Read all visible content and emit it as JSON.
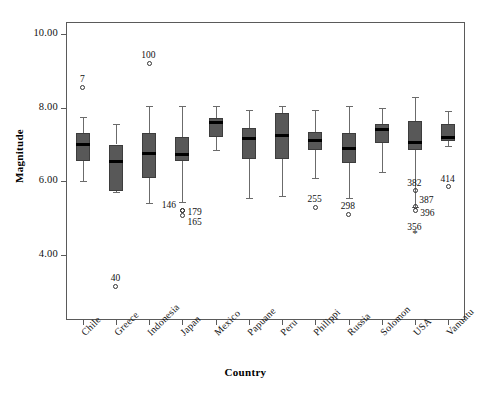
{
  "chart_data": {
    "type": "box",
    "title": "",
    "xlabel": "Country",
    "ylabel": "Magnitude",
    "ylim": [
      2.9,
      10.6
    ],
    "yticks": [
      4.0,
      6.0,
      8.0,
      10.0
    ],
    "ytick_labels": [
      "4.00",
      "6.00",
      "8.00",
      "10.00"
    ],
    "grid": false,
    "legend": "none",
    "categories": [
      "Chile",
      "Greece",
      "Indonesia",
      "Japan",
      "Mexico",
      "Papuane",
      "Peru",
      "Philippi",
      "Russia",
      "Solomon",
      "USA",
      "Vanuatu"
    ],
    "boxes": [
      {
        "category": "Chile",
        "whisker_low": 6.0,
        "q1": 6.55,
        "median": 7.0,
        "q3": 7.3,
        "whisker_high": 7.75
      },
      {
        "category": "Greece",
        "whisker_low": 5.7,
        "q1": 5.75,
        "median": 6.55,
        "q3": 7.0,
        "whisker_high": 7.55
      },
      {
        "category": "Indonesia",
        "whisker_low": 5.4,
        "q1": 6.1,
        "median": 6.75,
        "q3": 7.3,
        "whisker_high": 8.05
      },
      {
        "category": "Japan",
        "whisker_low": 5.45,
        "q1": 6.55,
        "median": 6.72,
        "q3": 7.2,
        "whisker_high": 8.05
      },
      {
        "category": "Mexico",
        "whisker_low": 6.85,
        "q1": 7.2,
        "median": 7.6,
        "q3": 7.72,
        "whisker_high": 8.05
      },
      {
        "category": "Papuane",
        "whisker_low": 5.55,
        "q1": 6.6,
        "median": 7.15,
        "q3": 7.45,
        "whisker_high": 7.95
      },
      {
        "category": "Peru",
        "whisker_low": 5.6,
        "q1": 6.6,
        "median": 7.25,
        "q3": 7.85,
        "whisker_high": 8.05
      },
      {
        "category": "Philippi",
        "whisker_low": 6.1,
        "q1": 6.85,
        "median": 7.1,
        "q3": 7.35,
        "whisker_high": 7.95
      },
      {
        "category": "Russia",
        "whisker_low": 5.55,
        "q1": 6.5,
        "median": 6.9,
        "q3": 7.3,
        "whisker_high": 8.05
      },
      {
        "category": "Solomon",
        "whisker_low": 6.25,
        "q1": 7.05,
        "median": 7.4,
        "q3": 7.55,
        "whisker_high": 8.0
      },
      {
        "category": "USA",
        "whisker_low": 5.3,
        "q1": 6.85,
        "median": 7.05,
        "q3": 7.65,
        "whisker_high": 8.3
      },
      {
        "category": "Vanuatu",
        "whisker_low": 6.95,
        "q1": 7.1,
        "median": 7.2,
        "q3": 7.55,
        "whisker_high": 7.9
      }
    ],
    "outliers": [
      {
        "category": "Chile",
        "value": 8.55,
        "label": "7",
        "symbol": "circle",
        "label_pos": "above"
      },
      {
        "category": "Greece",
        "value": 3.15,
        "label": "40",
        "symbol": "circle",
        "label_pos": "above"
      },
      {
        "category": "Indonesia",
        "value": 9.2,
        "label": "100",
        "symbol": "circle",
        "label_pos": "above"
      },
      {
        "category": "Japan",
        "value": 5.22,
        "label": "146",
        "symbol": "circle",
        "label_pos": "left"
      },
      {
        "category": "Japan",
        "value": 5.22,
        "label": "179",
        "symbol": "circle",
        "label_pos": "right"
      },
      {
        "category": "Japan",
        "value": 5.06,
        "label": "165",
        "symbol": "circle",
        "label_pos": "below-right"
      },
      {
        "category": "Philippi",
        "value": 5.3,
        "label": "255",
        "symbol": "circle",
        "label_pos": "above"
      },
      {
        "category": "Russia",
        "value": 5.1,
        "label": "298",
        "symbol": "circle",
        "label_pos": "above"
      },
      {
        "category": "USA",
        "value": 5.75,
        "label": "382",
        "symbol": "circle",
        "label_pos": "above"
      },
      {
        "category": "USA",
        "value": 5.33,
        "label": "387",
        "symbol": "circle",
        "label_pos": "above-right"
      },
      {
        "category": "USA",
        "value": 5.2,
        "label": "396",
        "symbol": "circle",
        "label_pos": "right"
      },
      {
        "category": "USA",
        "value": 4.55,
        "label": "356",
        "symbol": "asterisk",
        "label_pos": "above"
      },
      {
        "category": "Vanuatu",
        "value": 5.85,
        "label": "414",
        "symbol": "circle",
        "label_pos": "above"
      }
    ]
  },
  "colors": {
    "box_fill": "#585858",
    "box_stroke": "#3d3d3d",
    "median": "#000000",
    "whisker": "#6b6b6b",
    "frame": "#5a5a5a",
    "text": "#111111"
  }
}
